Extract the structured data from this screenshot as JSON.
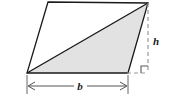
{
  "figure": {
    "type": "geometry-diagram",
    "canvas": {
      "width": 169,
      "height": 101,
      "background": "#ffffff"
    },
    "colors": {
      "outline": "#1a1a1a",
      "shaded_fill": "#e2e2e2",
      "unshaded_fill": "#ffffff",
      "dashed_line": "#9a9a9a",
      "dimension_line": "#555555"
    },
    "labels": {
      "base": "b",
      "height": "h"
    },
    "parallelogram": {
      "name": "parallelogram",
      "vertices": [
        {
          "name": "top-left",
          "x": 48,
          "y": 2
        },
        {
          "name": "top-right",
          "x": 148,
          "y": 3
        },
        {
          "name": "bottom-right",
          "x": 128,
          "y": 73
        },
        {
          "name": "bottom-left",
          "x": 27,
          "y": 73
        }
      ]
    },
    "shaded_triangle": {
      "name": "shaded-triangle",
      "vertices": [
        {
          "name": "bottom-left",
          "x": 27,
          "y": 73
        },
        {
          "name": "top-right",
          "x": 148,
          "y": 3
        },
        {
          "name": "bottom-right",
          "x": 128,
          "y": 73
        }
      ]
    },
    "diagonal": {
      "from_x": 27,
      "from_y": 73,
      "to_x": 148,
      "to_y": 3
    },
    "height_line": {
      "name": "height-dashed-line",
      "from_x": 148,
      "from_y": 3,
      "to_x": 148,
      "to_y": 73,
      "style": "dashed"
    },
    "base_extension_line": {
      "name": "base-dashed-extension",
      "from_x": 128,
      "from_y": 73,
      "to_x": 148,
      "to_y": 73,
      "style": "dashed"
    },
    "right_angle_marker": {
      "name": "right-angle-marker",
      "corner_x": 148,
      "corner_y": 73,
      "size": 7
    },
    "base_dimension": {
      "name": "base-dimension",
      "line_y": 86,
      "left_x": 27,
      "right_x": 128,
      "extension_top_y": 75,
      "extension_bottom_y": 94,
      "label_x": 80,
      "label_y": 90
    },
    "height_dimension": {
      "name": "height-dimension",
      "label_x": 156,
      "label_y": 45
    }
  }
}
